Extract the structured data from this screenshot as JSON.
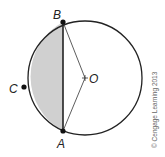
{
  "diagram": {
    "labels": {
      "B": "B",
      "A": "A",
      "C": "C",
      "O": "O"
    },
    "copyright": "© Cengage Learning 2013",
    "colors": {
      "stroke": "#222222",
      "segment_fill": "#d0d0d0",
      "background": "#ffffff"
    }
  }
}
